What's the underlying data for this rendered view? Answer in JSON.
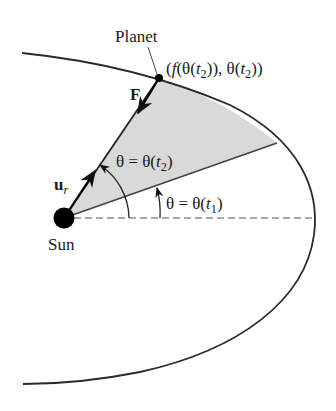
{
  "diagram": {
    "labels": {
      "planet": "Planet",
      "sun": "Sun",
      "force": "F",
      "unit_radial_base": "u",
      "unit_radial_sub": "r",
      "planet_coord_prefix": "(",
      "planet_coord_f": "f",
      "planet_coord_mid": "(θ(",
      "planet_coord_t": "t",
      "planet_coord_sub": "2",
      "planet_coord_close1": ")), θ(",
      "planet_coord_close2": "))",
      "theta2_prefix": "θ = θ(",
      "theta2_t": "t",
      "theta2_sub": "2",
      "theta2_suffix": ")",
      "theta1_prefix": "θ = θ(",
      "theta1_t": "t",
      "theta1_sub": "1",
      "theta1_suffix": ")"
    },
    "colors": {
      "stroke": "#2a2a2a",
      "shade": "#d9d9d9",
      "sun": "#000000"
    }
  }
}
